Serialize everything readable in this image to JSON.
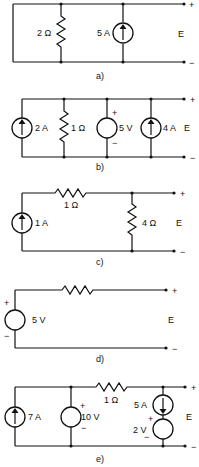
{
  "circuits": {
    "a": {
      "caption": "a)",
      "resistor_label": "2 Ω",
      "current_source_label": "5 A",
      "output_label": "E",
      "plus": "+",
      "minus": "−"
    },
    "b": {
      "caption": "b)",
      "current_source_1_label": "2 A",
      "resistor_label": "1 Ω",
      "voltage_source_label": "5 V",
      "voltage_plus": "+",
      "voltage_minus": "−",
      "current_source_2_label": "4 A",
      "output_label": "E",
      "plus": "+",
      "minus": "−"
    },
    "c": {
      "caption": "c)",
      "current_source_label": "1 A",
      "series_resistor_label": "1 Ω",
      "shunt_resistor_label": "4 Ω",
      "output_label": "E",
      "plus": "+",
      "minus": "−"
    },
    "d": {
      "caption": "d)",
      "voltage_source_label": "5 V",
      "voltage_plus": "+",
      "voltage_minus": "−",
      "output_label": "E",
      "plus": "+",
      "minus": "−"
    },
    "e": {
      "caption": "e)",
      "current_source_1_label": "7 A",
      "voltage_source_1_label": "10 V",
      "voltage_1_plus": "+",
      "voltage_1_minus": "−",
      "series_resistor_label": "1 Ω",
      "current_source_2_label": "5 A",
      "voltage_source_2_label": "2 V",
      "voltage_2_plus": "+",
      "voltage_2_minus": "−",
      "output_label": "E",
      "plus": "+",
      "minus": "−"
    }
  }
}
